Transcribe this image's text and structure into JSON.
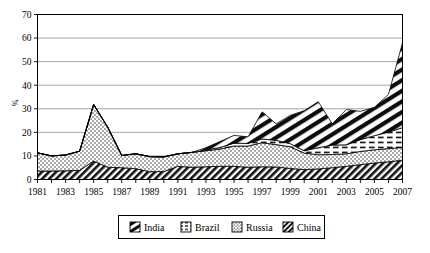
{
  "chart_data": {
    "type": "area",
    "stacked": true,
    "title": "",
    "xlabel": "",
    "ylabel": "%",
    "ylim": [
      0,
      70
    ],
    "ytick_step": 10,
    "yticks": [
      0,
      10,
      20,
      30,
      40,
      50,
      60,
      70
    ],
    "xlim": [
      1981,
      2007
    ],
    "grid": "horizontal",
    "legend_position": "bottom",
    "x": [
      1981,
      1982,
      1983,
      1984,
      1985,
      1986,
      1987,
      1988,
      1989,
      1990,
      1991,
      1992,
      1993,
      1994,
      1995,
      1996,
      1997,
      1998,
      1999,
      2000,
      2001,
      2002,
      2003,
      2004,
      2005,
      2006,
      2007
    ],
    "categories": [
      "1981",
      "1982",
      "1983",
      "1984",
      "1985",
      "1986",
      "1987",
      "1988",
      "1989",
      "1990",
      "1991",
      "1992",
      "1993",
      "1994",
      "1995",
      "1996",
      "1997",
      "1998",
      "1999",
      "2000",
      "2001",
      "2002",
      "2003",
      "2004",
      "2005",
      "2006",
      "2007"
    ],
    "xtick_labels": [
      "1981",
      "1983",
      "1985",
      "1987",
      "1989",
      "1991",
      "1993",
      "1995",
      "1997",
      "1999",
      "2001",
      "2003",
      "2005",
      "2007"
    ],
    "series": [
      {
        "name": "China",
        "pattern": "dense-diagonal",
        "stack_order": 1,
        "values": [
          3.6,
          3.6,
          3.7,
          3.9,
          7.8,
          5.2,
          5.0,
          4.6,
          3.3,
          3.4,
          5.6,
          5.2,
          5.4,
          5.6,
          5.6,
          5.2,
          5.4,
          5.3,
          4.7,
          4.2,
          4.5,
          5.0,
          5.6,
          6.3,
          7.0,
          7.5,
          8.2
        ]
      },
      {
        "name": "Russia",
        "pattern": "fine-dots",
        "stack_order": 2,
        "values": [
          7.7,
          6.4,
          6.7,
          8.1,
          24.0,
          17.0,
          5.2,
          6.3,
          6.4,
          6.2,
          5.3,
          6.3,
          6.8,
          7.3,
          8.6,
          9.0,
          10.2,
          9.5,
          9.2,
          7.0,
          6.0,
          5.6,
          5.3,
          5.6,
          5.6,
          5.6,
          5.4
        ]
      },
      {
        "name": "Brazil",
        "pattern": "dashes",
        "stack_order": 3,
        "values": [
          0.0,
          0.0,
          0.0,
          0.0,
          0.0,
          0.0,
          0.0,
          0.0,
          0.0,
          0.0,
          0.0,
          0.0,
          0.3,
          0.7,
          1.2,
          1.1,
          1.6,
          1.8,
          1.3,
          1.0,
          3.0,
          4.0,
          3.8,
          5.0,
          6.0,
          7.0,
          8.4
        ]
      },
      {
        "name": "India",
        "pattern": "bold-stripes",
        "stack_order": 4,
        "values": [
          0.0,
          0.0,
          0.0,
          0.0,
          0.0,
          0.0,
          0.0,
          0.0,
          0.0,
          0.0,
          0.0,
          0.0,
          1.0,
          2.5,
          3.3,
          2.8,
          11.5,
          7.0,
          12.0,
          17.0,
          19.5,
          9.0,
          15.0,
          12.0,
          12.0,
          16.0,
          36.0
        ]
      }
    ],
    "totals": [
      11.3,
      10.0,
      10.4,
      12.0,
      31.8,
      22.2,
      10.2,
      10.9,
      9.7,
      9.6,
      10.9,
      11.5,
      13.5,
      16.1,
      18.7,
      18.1,
      28.7,
      23.6,
      27.2,
      29.2,
      33.0,
      23.6,
      29.7,
      28.9,
      30.6,
      36.1,
      58.0
    ]
  },
  "legend": {
    "items": [
      {
        "label": "India"
      },
      {
        "label": "Brazil"
      },
      {
        "label": "Russia"
      },
      {
        "label": "China"
      }
    ]
  },
  "colors": {
    "ink": "#000000",
    "grid": "#9a9a9a",
    "frame": "#000000",
    "background": "#ffffff"
  }
}
